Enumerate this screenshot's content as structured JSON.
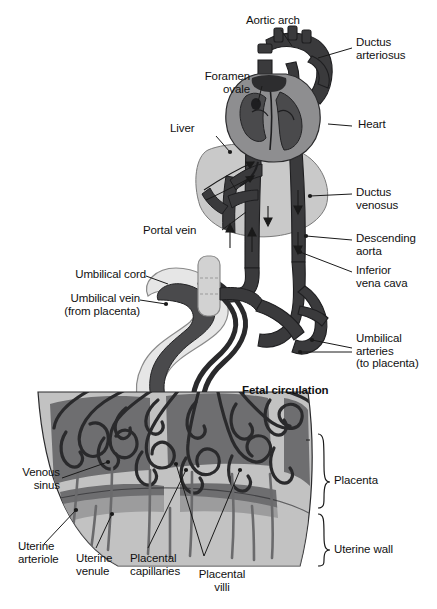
{
  "figure": {
    "title": "Fetal circulation",
    "type": "anatomical-diagram"
  },
  "labels": {
    "aortic_arch": "Aortic arch",
    "ductus_arteriosus": "Ductus\narteriosus",
    "foramen_ovale": "Foramen\novale",
    "heart": "Heart",
    "liver": "Liver",
    "ductus_venosus": "Ductus\nvenosus",
    "portal_vein": "Portal vein",
    "descending_aorta": "Descending\naorta",
    "inferior_vena_cava": "Inferior\nvena cava",
    "umbilical_cord": "Umbilical cord",
    "umbilical_vein": "Umbilical vein\n(from placenta)",
    "umbilical_arteries": "Umbilical\narteries\n(to placenta)",
    "fetal_circulation": "Fetal circulation",
    "placenta": "Placenta",
    "uterine_wall": "Uterine wall",
    "venous_sinus": "Venous\nsinus",
    "uterine_arteriole": "Uterine\narteriole",
    "uterine_venule": "Uterine\nvenule",
    "placental_capillaries": "Placental\ncapillaries",
    "placental_villi": "Placental\nvilli"
  },
  "colors": {
    "background": "#ffffff",
    "vessel_dark": "#3a3a3c",
    "vessel_darker": "#262628",
    "heart_wall": "#8e8e90",
    "heart_chamber": "#4a4a4c",
    "organ_light": "#c9c9c9",
    "cord_sheath": "#d9d9d9",
    "placenta_light": "#c2c2c2",
    "sinus_dark": "#6e6e70",
    "leader_line": "#1a1a1a",
    "text": "#111111"
  }
}
